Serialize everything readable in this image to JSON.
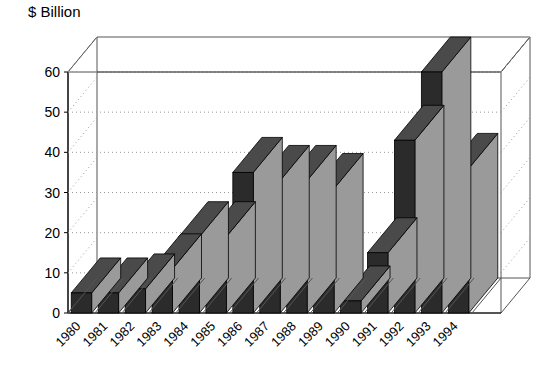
{
  "chart_data": {
    "type": "bar",
    "title": "$ Billion",
    "xlabel": "",
    "ylabel": "$ Billion",
    "categories": [
      "1980",
      "1981",
      "1982",
      "1983",
      "1984",
      "1985",
      "1986",
      "1987",
      "1988",
      "1989",
      "1990",
      "1991",
      "1992",
      "1993",
      "1994"
    ],
    "values": [
      5,
      5,
      6,
      11,
      19,
      19,
      35,
      33,
      33,
      31,
      3,
      15,
      43,
      60,
      36
    ],
    "ylim": [
      0,
      60
    ],
    "yticks": [
      0,
      10,
      20,
      30,
      40,
      50,
      60
    ],
    "ytick_labels": [
      "0",
      "10",
      "20",
      "30",
      "40",
      "50",
      "60"
    ],
    "grid": true,
    "grid_style": "dotted",
    "legend": "none",
    "legend_position": "none",
    "series": [
      {
        "name": "$ Billion",
        "values": [
          5,
          5,
          6,
          11,
          19,
          19,
          35,
          33,
          33,
          31,
          3,
          15,
          43,
          60,
          36
        ]
      }
    ],
    "style": {
      "three_d": true,
      "bar_front_color": "#2b2b2b",
      "bar_side_color": "#9a9a9a",
      "bar_top_color": "#4a4a4a",
      "axis_color": "#000000",
      "grid_color": "#9a9a9a",
      "background_color": "#ffffff",
      "xtick_rotation": -45
    }
  }
}
